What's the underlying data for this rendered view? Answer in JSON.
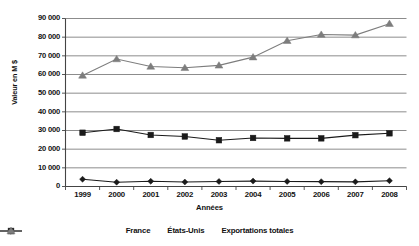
{
  "chart_data": {
    "type": "line",
    "title": "",
    "subtitle": "",
    "xlabel": "Années",
    "ylabel": "Valeur en M $",
    "categories": [
      "1999",
      "2000",
      "2001",
      "2002",
      "2003",
      "2004",
      "2005",
      "2006",
      "2007",
      "2008"
    ],
    "x": [
      1999,
      2000,
      2001,
      2002,
      2003,
      2004,
      2005,
      2006,
      2007,
      2008
    ],
    "ylim": [
      0,
      90000
    ],
    "ytick_labels": [
      "90 000",
      "80 000",
      "70 000",
      "60 000",
      "50 000",
      "40 000",
      "30 000",
      "20 000",
      "10 000",
      "0"
    ],
    "ytick_values": [
      90000,
      80000,
      70000,
      60000,
      50000,
      40000,
      30000,
      20000,
      10000,
      0
    ],
    "ytick_step": 10000,
    "grid": true,
    "grid_axis": "y",
    "legend_position": "bottom",
    "series": [
      {
        "name": "France",
        "marker": "diamond",
        "color": "#1a1a1a",
        "values": [
          3900,
          2300,
          2800,
          2400,
          2700,
          2900,
          2700,
          2600,
          2500,
          3100
        ]
      },
      {
        "name": "États-Unis",
        "marker": "square",
        "color": "#1a1a1a",
        "values": [
          28800,
          30800,
          27600,
          26800,
          24800,
          26000,
          25800,
          25800,
          27500,
          28500
        ]
      },
      {
        "name": "Exportations totales",
        "marker": "triangle",
        "color": "#7d7d7d",
        "values": [
          59500,
          68300,
          64300,
          63600,
          64900,
          69300,
          78100,
          81400,
          81100,
          87200
        ]
      }
    ]
  },
  "axis": {
    "ylabel": "Valeur en M $",
    "xlabel": "Années"
  },
  "legend": {
    "items": [
      {
        "label": "France",
        "marker": "diamond",
        "color": "#1a1a1a"
      },
      {
        "label": "États-Unis",
        "marker": "square",
        "color": "#1a1a1a"
      },
      {
        "label": "Exportations totales",
        "marker": "triangle",
        "color": "#7d7d7d"
      }
    ]
  },
  "colors": {
    "axis": "#444444",
    "grid": "#6e6e6e",
    "france": "#1a1a1a",
    "etats_unis": "#1a1a1a",
    "exportations": "#7d7d7d",
    "background": "#ffffff"
  }
}
